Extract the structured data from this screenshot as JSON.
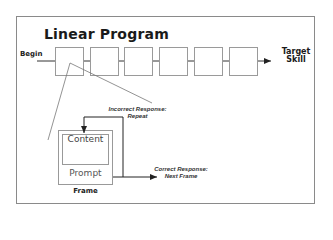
{
  "title": "Linear Program",
  "start_label": "Begin",
  "end_label_line1": "Target",
  "end_label_line2": "Skill",
  "frames_in_sequence": 6,
  "frame_detail": {
    "content_label": "Content",
    "prompt_label": "Prompt",
    "frame_label": "Frame"
  },
  "incorrect_response": {
    "line1": "Incorrect Response:",
    "line2": "Repeat"
  },
  "correct_response": {
    "line1": "Correct Response:",
    "line2": "Next Frame"
  },
  "colors": {
    "border": "#8a8a8a",
    "box_stroke": "#9a9a9a",
    "line": "#333333",
    "text": "#1a1a1a"
  }
}
